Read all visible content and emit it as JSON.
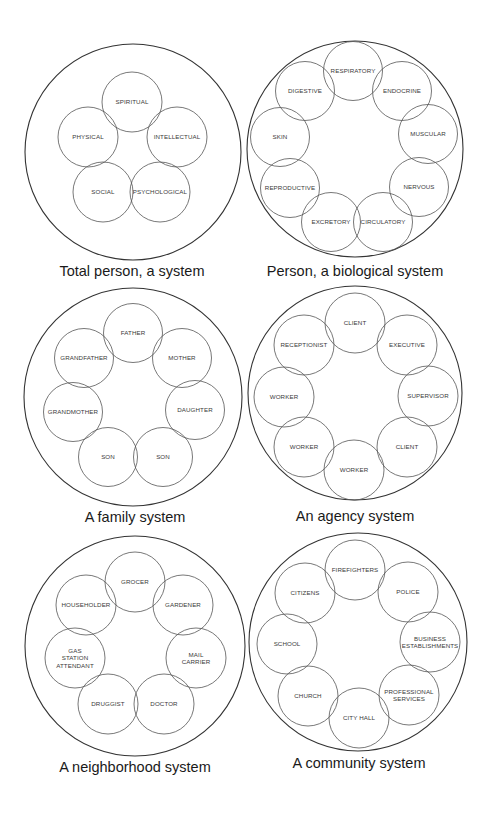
{
  "diagrams": [
    {
      "id": "total-person",
      "caption": "Total person, a system",
      "outer": {
        "cx": 133,
        "cy": 152,
        "r": 108
      },
      "caption_pos": {
        "x": 132,
        "y": 276
      },
      "node_r": 30,
      "nodes": [
        {
          "label": [
            "SPIRITUAL"
          ],
          "cx": 132,
          "cy": 102
        },
        {
          "label": [
            "INTELLECTUAL"
          ],
          "cx": 177,
          "cy": 137
        },
        {
          "label": [
            "PSYCHOLOGICAL"
          ],
          "cx": 160,
          "cy": 192
        },
        {
          "label": [
            "SOCIAL"
          ],
          "cx": 103,
          "cy": 192
        },
        {
          "label": [
            "PHYSICAL"
          ],
          "cx": 88,
          "cy": 137
        }
      ]
    },
    {
      "id": "biological",
      "caption": "Person, a biological system",
      "outer": {
        "cx": 355,
        "cy": 149,
        "r": 108
      },
      "caption_pos": {
        "x": 355,
        "y": 276
      },
      "node_r": 29.5,
      "nodes": [
        {
          "label": [
            "RESPIRATORY"
          ],
          "cx": 353,
          "cy": 71
        },
        {
          "label": [
            "ENDOCRINE"
          ],
          "cx": 402,
          "cy": 91
        },
        {
          "label": [
            "MUSCULAR"
          ],
          "cx": 428,
          "cy": 134
        },
        {
          "label": [
            "NERVOUS"
          ],
          "cx": 419,
          "cy": 187
        },
        {
          "label": [
            "CIRCULATORY"
          ],
          "cx": 383,
          "cy": 222
        },
        {
          "label": [
            "EXCRETORY"
          ],
          "cx": 331,
          "cy": 222
        },
        {
          "label": [
            "REPRODUCTIVE"
          ],
          "cx": 290,
          "cy": 188
        },
        {
          "label": [
            "SKIN"
          ],
          "cx": 280,
          "cy": 137
        },
        {
          "label": [
            "DIGESTIVE"
          ],
          "cx": 305,
          "cy": 91
        }
      ]
    },
    {
      "id": "family",
      "caption": "A family system",
      "outer": {
        "cx": 133,
        "cy": 397,
        "r": 109
      },
      "caption_pos": {
        "x": 135,
        "y": 522
      },
      "node_r": 29.5,
      "nodes": [
        {
          "label": [
            "FATHER"
          ],
          "cx": 133,
          "cy": 333
        },
        {
          "label": [
            "MOTHER"
          ],
          "cx": 182,
          "cy": 358
        },
        {
          "label": [
            "DAUGHTER"
          ],
          "cx": 195,
          "cy": 410
        },
        {
          "label": [
            "SON"
          ],
          "cx": 163,
          "cy": 457
        },
        {
          "label": [
            "SON"
          ],
          "cx": 108,
          "cy": 457
        },
        {
          "label": [
            "GRANDMOTHER"
          ],
          "cx": 73,
          "cy": 412
        },
        {
          "label": [
            "GRANDFATHER"
          ],
          "cx": 84,
          "cy": 358
        }
      ]
    },
    {
      "id": "agency",
      "caption": "An agency system",
      "outer": {
        "cx": 355,
        "cy": 393,
        "r": 107
      },
      "caption_pos": {
        "x": 355,
        "y": 521
      },
      "node_r": 30,
      "nodes": [
        {
          "label": [
            "CLIENT"
          ],
          "cx": 355,
          "cy": 323
        },
        {
          "label": [
            "EXECUTIVE"
          ],
          "cx": 407,
          "cy": 345
        },
        {
          "label": [
            "SUPERVISOR"
          ],
          "cx": 428,
          "cy": 396
        },
        {
          "label": [
            "CLIENT"
          ],
          "cx": 407,
          "cy": 447
        },
        {
          "label": [
            "WORKER"
          ],
          "cx": 354,
          "cy": 470
        },
        {
          "label": [
            "WORKER"
          ],
          "cx": 304,
          "cy": 447
        },
        {
          "label": [
            "WORKER"
          ],
          "cx": 284,
          "cy": 397
        },
        {
          "label": [
            "RECEPTIONIST"
          ],
          "cx": 304,
          "cy": 345
        }
      ]
    },
    {
      "id": "neighborhood",
      "caption": "A neighborhood system",
      "outer": {
        "cx": 135,
        "cy": 646,
        "r": 110
      },
      "caption_pos": {
        "x": 135,
        "y": 772
      },
      "node_r": 30,
      "nodes": [
        {
          "label": [
            "GROCER"
          ],
          "cx": 135,
          "cy": 582
        },
        {
          "label": [
            "GARDENER"
          ],
          "cx": 183,
          "cy": 605
        },
        {
          "label": [
            "MAIL",
            "CARRIER"
          ],
          "cx": 196,
          "cy": 658
        },
        {
          "label": [
            "DOCTOR"
          ],
          "cx": 164,
          "cy": 704
        },
        {
          "label": [
            "DRUGGIST"
          ],
          "cx": 108,
          "cy": 704
        },
        {
          "label": [
            "GAS",
            "STATION",
            "ATTENDANT"
          ],
          "cx": 75,
          "cy": 658
        },
        {
          "label": [
            "HOUSEHOLDER"
          ],
          "cx": 86,
          "cy": 605
        }
      ]
    },
    {
      "id": "community",
      "caption": "A community system",
      "outer": {
        "cx": 358,
        "cy": 642,
        "r": 109
      },
      "caption_pos": {
        "x": 359,
        "y": 768
      },
      "node_r": 30,
      "nodes": [
        {
          "label": [
            "FIREFIGHTERS"
          ],
          "cx": 355,
          "cy": 570
        },
        {
          "label": [
            "POLICE"
          ],
          "cx": 408,
          "cy": 592
        },
        {
          "label": [
            "BUSINESS",
            "ESTABLISHMENTS"
          ],
          "cx": 430,
          "cy": 642
        },
        {
          "label": [
            "PROFESSIONAL",
            "SERVICES"
          ],
          "cx": 409,
          "cy": 695
        },
        {
          "label": [
            "CITY HALL"
          ],
          "cx": 359,
          "cy": 718
        },
        {
          "label": [
            "CHURCH"
          ],
          "cx": 308,
          "cy": 696
        },
        {
          "label": [
            "SCHOOL"
          ],
          "cx": 287,
          "cy": 644
        },
        {
          "label": [
            "CITIZENS"
          ],
          "cx": 305,
          "cy": 593
        }
      ]
    }
  ]
}
